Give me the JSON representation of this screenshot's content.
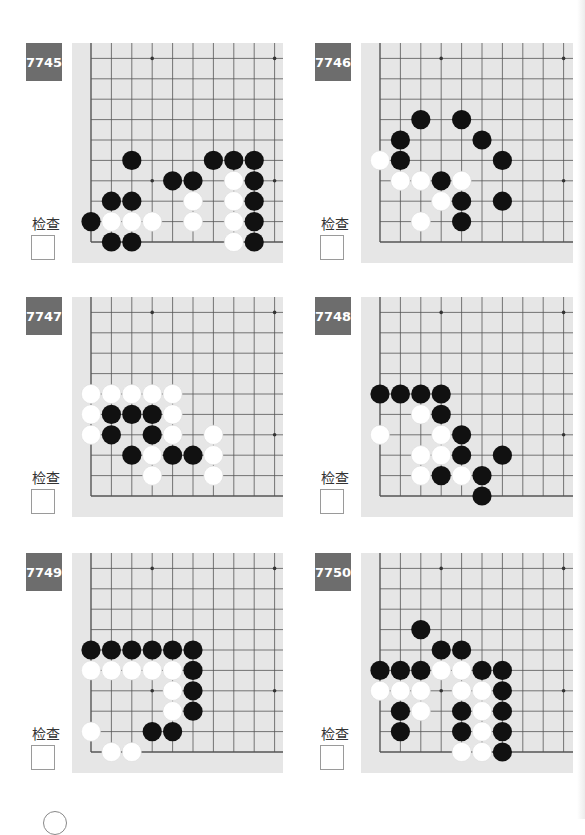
{
  "page": {
    "check_label": "检查"
  },
  "colors": {
    "board": "#e6e6e6",
    "grid_line": "#555555",
    "badge": "#6d6d6d",
    "black_stone": "#111111",
    "white_stone": "#ffffff"
  },
  "problems": [
    {
      "number": "7745",
      "check_label": "检查",
      "checked": false,
      "black": [
        [
          2,
          4
        ],
        [
          6,
          4
        ],
        [
          7,
          4
        ],
        [
          8,
          4
        ],
        [
          4,
          3
        ],
        [
          5,
          3
        ],
        [
          8,
          3
        ],
        [
          1,
          2
        ],
        [
          2,
          2
        ],
        [
          8,
          2
        ],
        [
          0,
          1
        ],
        [
          8,
          1
        ],
        [
          1,
          0
        ],
        [
          2,
          0
        ],
        [
          8,
          0
        ]
      ],
      "white": [
        [
          7,
          3
        ],
        [
          5,
          2
        ],
        [
          7,
          2
        ],
        [
          1,
          1
        ],
        [
          2,
          1
        ],
        [
          3,
          1
        ],
        [
          5,
          1
        ],
        [
          7,
          1
        ],
        [
          7,
          0
        ]
      ]
    },
    {
      "number": "7746",
      "check_label": "检查",
      "checked": false,
      "black": [
        [
          2,
          6
        ],
        [
          4,
          6
        ],
        [
          1,
          5
        ],
        [
          5,
          5
        ],
        [
          1,
          4
        ],
        [
          6,
          4
        ],
        [
          3,
          3
        ],
        [
          4,
          2
        ],
        [
          6,
          2
        ],
        [
          4,
          1
        ]
      ],
      "white": [
        [
          0,
          4
        ],
        [
          1,
          3
        ],
        [
          2,
          3
        ],
        [
          4,
          3
        ],
        [
          3,
          2
        ],
        [
          2,
          1
        ]
      ]
    },
    {
      "number": "7747",
      "check_label": "检查",
      "checked": false,
      "black": [
        [
          1,
          4
        ],
        [
          2,
          4
        ],
        [
          3,
          4
        ],
        [
          1,
          3
        ],
        [
          3,
          3
        ],
        [
          2,
          2
        ],
        [
          4,
          2
        ],
        [
          5,
          2
        ]
      ],
      "white": [
        [
          0,
          5
        ],
        [
          1,
          5
        ],
        [
          2,
          5
        ],
        [
          3,
          5
        ],
        [
          4,
          5
        ],
        [
          0,
          4
        ],
        [
          4,
          4
        ],
        [
          0,
          3
        ],
        [
          4,
          3
        ],
        [
          6,
          3
        ],
        [
          3,
          2
        ],
        [
          6,
          2
        ],
        [
          3,
          1
        ],
        [
          6,
          1
        ]
      ]
    },
    {
      "number": "7748",
      "check_label": "检查",
      "checked": false,
      "black": [
        [
          0,
          5
        ],
        [
          1,
          5
        ],
        [
          2,
          5
        ],
        [
          3,
          5
        ],
        [
          3,
          4
        ],
        [
          4,
          3
        ],
        [
          4,
          2
        ],
        [
          6,
          2
        ],
        [
          3,
          1
        ],
        [
          5,
          1
        ],
        [
          5,
          0
        ]
      ],
      "white": [
        [
          2,
          4
        ],
        [
          0,
          3
        ],
        [
          3,
          3
        ],
        [
          2,
          2
        ],
        [
          3,
          2
        ],
        [
          2,
          1
        ],
        [
          4,
          1
        ]
      ]
    },
    {
      "number": "7749",
      "check_label": "检查",
      "checked": false,
      "black": [
        [
          0,
          5
        ],
        [
          1,
          5
        ],
        [
          2,
          5
        ],
        [
          3,
          5
        ],
        [
          4,
          5
        ],
        [
          5,
          5
        ],
        [
          5,
          4
        ],
        [
          5,
          3
        ],
        [
          5,
          2
        ],
        [
          3,
          1
        ],
        [
          4,
          1
        ]
      ],
      "white": [
        [
          0,
          4
        ],
        [
          1,
          4
        ],
        [
          2,
          4
        ],
        [
          3,
          4
        ],
        [
          4,
          4
        ],
        [
          4,
          3
        ],
        [
          4,
          2
        ],
        [
          0,
          1
        ],
        [
          1,
          0
        ],
        [
          2,
          0
        ]
      ]
    },
    {
      "number": "7750",
      "check_label": "检查",
      "checked": false,
      "black": [
        [
          2,
          6
        ],
        [
          3,
          5
        ],
        [
          4,
          5
        ],
        [
          0,
          4
        ],
        [
          1,
          4
        ],
        [
          2,
          4
        ],
        [
          5,
          4
        ],
        [
          6,
          4
        ],
        [
          6,
          3
        ],
        [
          1,
          2
        ],
        [
          4,
          2
        ],
        [
          6,
          2
        ],
        [
          1,
          1
        ],
        [
          4,
          1
        ],
        [
          6,
          1
        ],
        [
          6,
          0
        ]
      ],
      "white": [
        [
          3,
          4
        ],
        [
          4,
          4
        ],
        [
          0,
          3
        ],
        [
          1,
          3
        ],
        [
          2,
          3
        ],
        [
          4,
          3
        ],
        [
          5,
          3
        ],
        [
          2,
          2
        ],
        [
          5,
          2
        ],
        [
          5,
          1
        ],
        [
          4,
          0
        ],
        [
          5,
          0
        ]
      ]
    }
  ]
}
